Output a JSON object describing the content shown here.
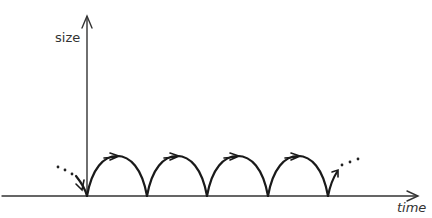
{
  "diagram": {
    "y_axis_label": "size",
    "x_axis_label": "time",
    "colors": {
      "axis": "#333333",
      "curve": "#1a1a1a",
      "dots": "#222222"
    },
    "arches": {
      "count": 4,
      "cusps_x": [
        87,
        147,
        207,
        268,
        328
      ],
      "baseline_y": 196,
      "peak_y": 156
    },
    "continuation": {
      "left": "dotted-incoming",
      "right": "dotted-outgoing"
    }
  }
}
